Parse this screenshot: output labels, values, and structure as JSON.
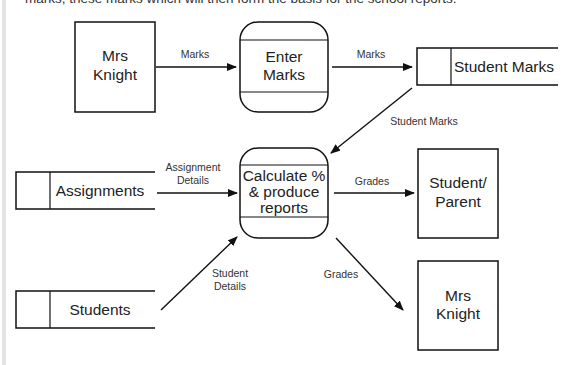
{
  "intro_text_partial": "marks, these marks which will then form the basis for the school reports.",
  "entities": {
    "mrs_knight_top": [
      "Mrs",
      "Knight"
    ],
    "student_parent": [
      "Student/",
      "Parent"
    ],
    "mrs_knight_bottom": [
      "Mrs",
      "Knight"
    ]
  },
  "processes": {
    "enter_marks": [
      "Enter",
      "Marks"
    ],
    "calculate": [
      "Calculate %",
      "& produce",
      "reports"
    ]
  },
  "stores": {
    "student_marks": "Student Marks",
    "assignments": "Assignments",
    "students": "Students"
  },
  "flows": {
    "marks_1": "Marks",
    "marks_2": "Marks",
    "student_marks": "Student Marks",
    "assignment_details": [
      "Assignment",
      "Details"
    ],
    "grades_1": "Grades",
    "student_details": [
      "Student",
      "Details"
    ],
    "grades_2": "Grades"
  }
}
